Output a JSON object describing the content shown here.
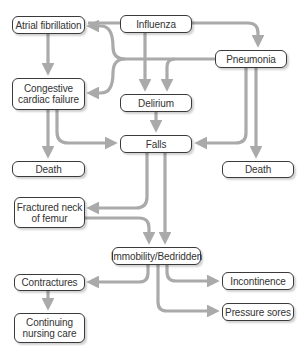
{
  "diagram": {
    "type": "flowchart",
    "colors": {
      "arrow": "#aaaaaa",
      "border": "#3a3a3a",
      "text": "#333333",
      "background": "#ffffff"
    },
    "nodes": {
      "atrial_fibrillation": "Atrial fibrillation",
      "influenza": "Influenza",
      "pneumonia": "Pneumonia",
      "congestive_line1": "Congestive",
      "congestive_line2": "cardiac failure",
      "delirium": "Delirium",
      "falls": "Falls",
      "death_left": "Death",
      "death_right": "Death",
      "fractured_line1": "Fractured neck",
      "fractured_line2": "of femur",
      "immobility": "Immobility/Bedridden",
      "contractures": "Contractures",
      "incontinence": "Incontinence",
      "continuing_line1": "Continuing",
      "continuing_line2": "nursing care",
      "pressure_sores": "Pressure sores"
    },
    "edges": [
      [
        "Influenza",
        "Atrial fibrillation"
      ],
      [
        "Influenza",
        "Congestive cardiac failure"
      ],
      [
        "Influenza",
        "Delirium"
      ],
      [
        "Influenza",
        "Pneumonia"
      ],
      [
        "Pneumonia",
        "Delirium"
      ],
      [
        "Pneumonia",
        "Atrial fibrillation"
      ],
      [
        "Pneumonia",
        "Congestive cardiac failure"
      ],
      [
        "Pneumonia",
        "Falls"
      ],
      [
        "Pneumonia",
        "Death"
      ],
      [
        "Atrial fibrillation",
        "Congestive cardiac failure"
      ],
      [
        "Congestive cardiac failure",
        "Death"
      ],
      [
        "Congestive cardiac failure",
        "Falls"
      ],
      [
        "Delirium",
        "Falls"
      ],
      [
        "Falls",
        "Fractured neck of femur"
      ],
      [
        "Falls",
        "Immobility/Bedridden"
      ],
      [
        "Fractured neck of femur",
        "Immobility/Bedridden"
      ],
      [
        "Immobility/Bedridden",
        "Contractures"
      ],
      [
        "Immobility/Bedridden",
        "Incontinence"
      ],
      [
        "Immobility/Bedridden",
        "Pressure sores"
      ],
      [
        "Contractures",
        "Continuing nursing care"
      ]
    ]
  }
}
